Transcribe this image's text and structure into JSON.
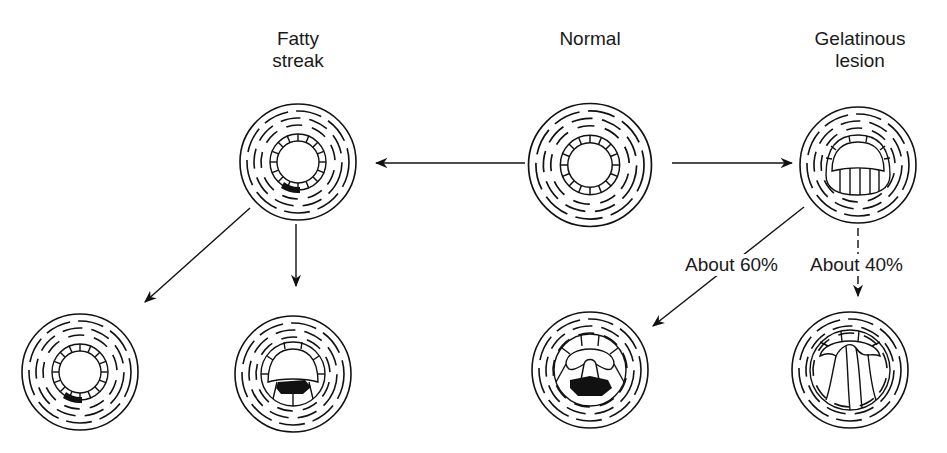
{
  "labels": {
    "fatty_streak": "Fatty\nstreak",
    "normal": "Normal",
    "gelatinous_lesion": "Gelatinous\nlesion"
  },
  "branch_labels": {
    "about_60": "About 60%",
    "about_40": "About 40%"
  },
  "nodes": [
    {
      "id": "fatty-streak",
      "label": "Fatty streak"
    },
    {
      "id": "normal",
      "label": "Normal"
    },
    {
      "id": "gelatinous-lesion",
      "label": "Gelatinous lesion"
    },
    {
      "id": "fatty-streak-outcome-1",
      "label": ""
    },
    {
      "id": "fatty-streak-outcome-2",
      "label": ""
    },
    {
      "id": "gelatinous-outcome-60",
      "label": ""
    },
    {
      "id": "gelatinous-outcome-40",
      "label": ""
    }
  ],
  "edges": [
    {
      "from": "normal",
      "to": "fatty-streak",
      "label": ""
    },
    {
      "from": "normal",
      "to": "gelatinous-lesion",
      "label": ""
    },
    {
      "from": "fatty-streak",
      "to": "fatty-streak-outcome-1",
      "label": ""
    },
    {
      "from": "fatty-streak",
      "to": "fatty-streak-outcome-2",
      "label": ""
    },
    {
      "from": "gelatinous-lesion",
      "to": "gelatinous-outcome-60",
      "label": "About 60%"
    },
    {
      "from": "gelatinous-lesion",
      "to": "gelatinous-outcome-40",
      "label": "About 40%"
    }
  ]
}
